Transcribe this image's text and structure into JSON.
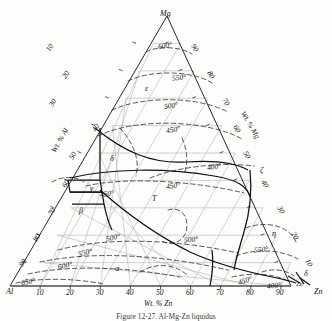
{
  "figure": {
    "type": "ternary-phase-diagram",
    "system": "Al-Mg-Zn",
    "caption": "Figure    12-27.  Al-Mg-Zn liquidus"
  },
  "corners": {
    "top": {
      "label": "Mg",
      "x": 167,
      "y": 16
    },
    "left": {
      "label": "Al",
      "x": 10,
      "y": 293
    },
    "right": {
      "label": "Zn",
      "x": 318,
      "y": 293
    }
  },
  "axes": [
    {
      "name": "bottom-axis",
      "title": "Wt. % Zn",
      "title_x": 166,
      "title_y": 305,
      "ticks": [
        "10",
        "20",
        "30",
        "40",
        "50",
        "60",
        "70",
        "80",
        "90"
      ]
    },
    {
      "name": "left-axis",
      "title": "Wt. % Al",
      "title_x": 76,
      "title_y": 150,
      "ticks": [
        "10",
        "20",
        "30",
        "40",
        "50",
        "60",
        "70",
        "80",
        "90"
      ]
    },
    {
      "name": "right-axis",
      "title": "Wt. % Mg",
      "title_x": 253,
      "title_y": 128,
      "ticks": [
        "90",
        "80",
        "70",
        "60",
        "50",
        "40",
        "30",
        "20",
        "10"
      ]
    }
  ],
  "tick_labels": {
    "left": [
      {
        "t": "10",
        "x": 52,
        "y": 48
      },
      {
        "t": "20",
        "x": 71,
        "y": 78
      },
      {
        "t": "30",
        "x": 56,
        "y": 107
      },
      {
        "t": "40",
        "x": 101,
        "y": 131
      },
      {
        "t": "50",
        "x": 76,
        "y": 160
      },
      {
        "t": "60",
        "x": 69,
        "y": 189
      },
      {
        "t": "70",
        "x": 55,
        "y": 216
      },
      {
        "t": "80",
        "x": 38,
        "y": 240
      },
      {
        "t": "90",
        "x": 23,
        "y": 265
      }
    ],
    "right": [
      {
        "t": "90",
        "x": 196,
        "y": 50
      },
      {
        "t": "80",
        "x": 212,
        "y": 77
      },
      {
        "t": "70",
        "x": 228,
        "y": 104
      },
      {
        "t": "60",
        "x": 239,
        "y": 131
      },
      {
        "t": "50",
        "x": 249,
        "y": 157
      },
      {
        "t": "40",
        "x": 267,
        "y": 186
      },
      {
        "t": "30",
        "x": 283,
        "y": 212
      },
      {
        "t": "20",
        "x": 297,
        "y": 238
      },
      {
        "t": "10",
        "x": 311,
        "y": 265
      }
    ],
    "bottom": [
      {
        "t": "10",
        "x": 48,
        "y": 291
      },
      {
        "t": "20",
        "x": 78,
        "y": 291
      },
      {
        "t": "30",
        "x": 110,
        "y": 291
      },
      {
        "t": "40",
        "x": 140,
        "y": 291
      },
      {
        "t": "50",
        "x": 170,
        "y": 291
      },
      {
        "t": "60",
        "x": 200,
        "y": 291
      },
      {
        "t": "70",
        "x": 230,
        "y": 291
      },
      {
        "t": "80",
        "x": 260,
        "y": 291
      },
      {
        "t": "90",
        "x": 290,
        "y": 291
      }
    ]
  },
  "isotherm_labels": [
    {
      "t": "600°",
      "x": 171,
      "y": 48,
      "rot": -8
    },
    {
      "t": "550°",
      "x": 186,
      "y": 80,
      "rot": -6
    },
    {
      "t": "500°",
      "x": 178,
      "y": 108,
      "rot": -8
    },
    {
      "t": "450°",
      "x": 180,
      "y": 132,
      "rot": -10
    },
    {
      "t": "400°",
      "x": 221,
      "y": 169,
      "rot": -8
    },
    {
      "t": "450°",
      "x": 180,
      "y": 188,
      "rot": -8
    },
    {
      "t": "450°",
      "x": 114,
      "y": 196,
      "rot": -8
    },
    {
      "t": "500°",
      "x": 198,
      "y": 242,
      "rot": -6
    },
    {
      "t": "500°",
      "x": 120,
      "y": 240,
      "rot": -12
    },
    {
      "t": "550°",
      "x": 92,
      "y": 255,
      "rot": -14
    },
    {
      "t": "550°",
      "x": 268,
      "y": 252,
      "rot": -6
    },
    {
      "t": "600°",
      "x": 72,
      "y": 268,
      "rot": -12
    },
    {
      "t": "650°",
      "x": 35,
      "y": 284,
      "rot": -10
    },
    {
      "t": "450°",
      "x": 252,
      "y": 283,
      "rot": -18
    },
    {
      "t": "400°",
      "x": 281,
      "y": 288,
      "rot": -6
    }
  ],
  "phase_labels": [
    {
      "t": "ε",
      "x": 148,
      "y": 90
    },
    {
      "t": "δ",
      "x": 113,
      "y": 160
    },
    {
      "t": "γ",
      "x": 93,
      "y": 190
    },
    {
      "t": "β",
      "x": 82,
      "y": 212
    },
    {
      "t": "T",
      "x": 155,
      "y": 200
    },
    {
      "t": "ζ",
      "x": 262,
      "y": 172
    },
    {
      "t": "η",
      "x": 275,
      "y": 235
    },
    {
      "t": "α",
      "x": 118,
      "y": 270
    },
    {
      "t": "δ",
      "x": 306,
      "y": 276
    },
    {
      "t": "Zn",
      "x": 312,
      "y": 288
    }
  ],
  "colors": {
    "grid": "#9a9a9a",
    "boundary": "#111111",
    "isotherm": "#2a2a2a",
    "background": "#fdfdfb"
  }
}
